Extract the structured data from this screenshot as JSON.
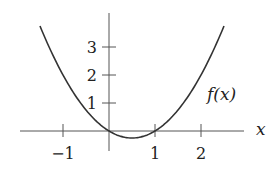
{
  "chart_data": {
    "type": "line",
    "title": "",
    "xlabel": "x",
    "ylabel": "",
    "function": "f(x) = x^2 - x",
    "curve_label": "f(x)",
    "x_ticks": [
      -1,
      1,
      2
    ],
    "x_tick_labels": [
      "−1",
      "1",
      "2"
    ],
    "y_ticks": [
      1,
      2,
      3
    ],
    "y_tick_labels": [
      "1",
      "2",
      "3"
    ],
    "xlim": [
      -2,
      3.2
    ],
    "ylim": [
      -0.5,
      4
    ],
    "grid": false,
    "series": [
      {
        "name": "f(x)",
        "x": [
          -1.5,
          -1,
          -0.5,
          0,
          0.5,
          1,
          1.5,
          2,
          2.5
        ],
        "y": [
          3.75,
          2,
          0.75,
          0,
          -0.25,
          0,
          0.75,
          2,
          3.75
        ]
      }
    ]
  },
  "labels": {
    "x_axis": "x",
    "curve": "f(x)",
    "xt_m1": "−1",
    "xt_1": "1",
    "xt_2": "2",
    "yt_1": "1",
    "yt_2": "2",
    "yt_3": "3"
  }
}
